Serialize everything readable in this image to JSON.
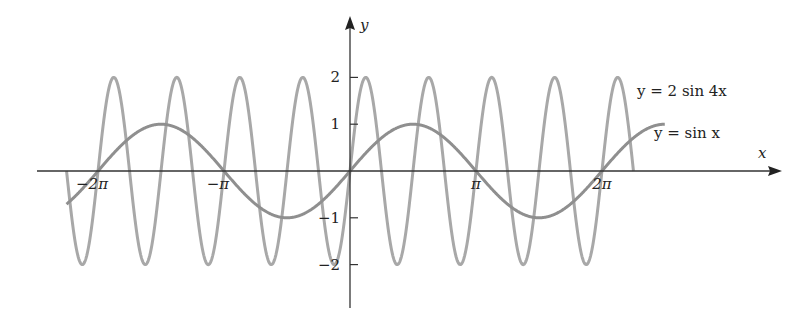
{
  "chart_data": {
    "type": "line",
    "title": "",
    "xlabel": "x",
    "ylabel": "y",
    "xlim": [
      -6.81,
      7.85
    ],
    "ylim": [
      -2.9,
      3.3
    ],
    "grid": false,
    "legend_position": "inline-right",
    "x_ticks": [
      {
        "value": -6.2832,
        "label": "−2π"
      },
      {
        "value": -3.1416,
        "label": "−π"
      },
      {
        "value": 3.1416,
        "label": "π"
      },
      {
        "value": 6.2832,
        "label": "2π"
      }
    ],
    "y_ticks": [
      {
        "value": 2,
        "label": "2"
      },
      {
        "value": 1,
        "label": "1"
      },
      {
        "value": -1,
        "label": "−1"
      },
      {
        "value": -2,
        "label": "−2"
      }
    ],
    "series": [
      {
        "name": "y = 2 sin 4x",
        "function": "2*sin(4*x)",
        "domain": [
          -7.0686,
          7.0686
        ],
        "color": "#a8a8a8",
        "label_pos": {
          "x": 637,
          "y": 96
        }
      },
      {
        "name": "y = sin x",
        "function": "sin(x)",
        "domain": [
          -7.07,
          7.85
        ],
        "color": "#8f8f8f",
        "label_pos": {
          "x": 654,
          "y": 138
        }
      }
    ],
    "annotations": [
      "y = 2 sin 4x",
      "y = sin x"
    ]
  },
  "axes": {
    "x_label": "x",
    "y_label": "y"
  }
}
